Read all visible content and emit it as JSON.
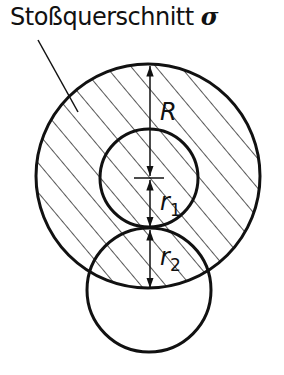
{
  "title": {
    "text": "Stoßquerschnitt",
    "symbol": "σ"
  },
  "labels": {
    "R": "R",
    "r1_base": "r",
    "r1_sub": "1",
    "r2_base": "r",
    "r2_sub": "2"
  },
  "colors": {
    "stroke": "#111111",
    "background": "#ffffff"
  }
}
